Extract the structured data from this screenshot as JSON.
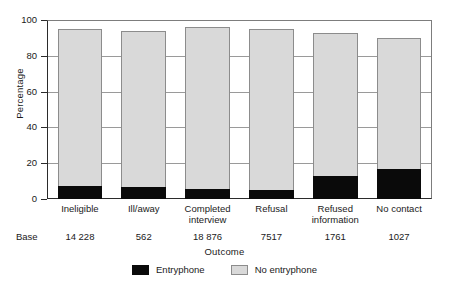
{
  "chart_data": {
    "type": "bar",
    "subtype": "stacked-bar",
    "title": "",
    "xlabel": "Outcome",
    "ylabel": "Percentage",
    "ylim": [
      0,
      100
    ],
    "yticks": [
      0,
      20,
      40,
      60,
      80,
      100
    ],
    "grid": true,
    "legend_position": "bottom",
    "categories": [
      "Ineligible",
      "Ill/away",
      "Completed interview",
      "Refusal",
      "Refused information",
      "No contact"
    ],
    "category_lines": [
      [
        "Ineligible"
      ],
      [
        "Ill/away"
      ],
      [
        "Completed",
        "interview"
      ],
      [
        "Refusal"
      ],
      [
        "Refused",
        "information"
      ],
      [
        "No contact"
      ]
    ],
    "series": [
      {
        "name": "Entryphone",
        "color": "#0a0a0a",
        "values": [
          7,
          6.5,
          5.5,
          5,
          13,
          17
        ]
      },
      {
        "name": "No entryphone",
        "color": "#d9d9d9",
        "values": [
          88,
          87.5,
          90.5,
          90,
          80,
          73
        ]
      }
    ],
    "totals": [
      95,
      94,
      96,
      95,
      93,
      90
    ],
    "base_label": "Base",
    "base_values": [
      "14 228",
      "562",
      "18 876",
      "7517",
      "1761",
      "1027"
    ]
  },
  "axis": {
    "y_title": "Percentage",
    "x_title": "Outcome",
    "y_tick_labels": [
      "0",
      "20",
      "40",
      "60",
      "80",
      "100"
    ]
  },
  "legend": {
    "items": [
      {
        "label": "Entryphone",
        "swatch": "black-swatch"
      },
      {
        "label": "No entryphone",
        "swatch": "grey-swatch"
      }
    ]
  },
  "colors": {
    "entryphone": "#0a0a0a",
    "no_entryphone": "#d9d9d9",
    "bar_border": "#8c8c8c",
    "axis": "#2b2b2b",
    "gridline": "#9a9a9a",
    "background": "#ffffff"
  }
}
